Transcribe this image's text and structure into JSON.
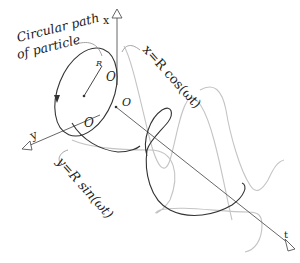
{
  "diagram": {
    "title_label": {
      "line1": "Circular path",
      "line2": "of particle"
    },
    "axes": {
      "x": "x",
      "y": "y",
      "t": "t"
    },
    "origin_labels": [
      "O",
      "O",
      "O"
    ],
    "radius_label": "R",
    "equations": {
      "x_projection": "x=R cos(ωt)",
      "y_projection": "y=R sin(ωt)"
    },
    "colors": {
      "helix": "#333333",
      "projection_curves": "#c4c4c4",
      "axes": "#555555"
    }
  }
}
